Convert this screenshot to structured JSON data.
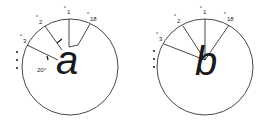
{
  "figures": [
    {
      "id": "left",
      "letter": "a",
      "labels": {
        "x1": {
          "prefix": "x",
          "sub": "1"
        },
        "x2": {
          "prefix": "x",
          "sub": "2"
        },
        "x3": {
          "prefix": "x",
          "sub": "3"
        },
        "x18": {
          "prefix": "x",
          "sub": "18"
        }
      },
      "angle_label": "20°",
      "ellipsis": "⋮"
    },
    {
      "id": "right",
      "letter": "b",
      "labels": {
        "x1": {
          "prefix": "x",
          "sub": "1"
        },
        "x2": {
          "prefix": "x",
          "sub": "2"
        },
        "x3": {
          "prefix": "x",
          "sub": "3"
        },
        "x18": {
          "prefix": "x",
          "sub": "18"
        }
      },
      "ellipsis": "⋮"
    }
  ],
  "colors": {
    "ink": "#1a1a1a",
    "background": "#ffffff"
  }
}
